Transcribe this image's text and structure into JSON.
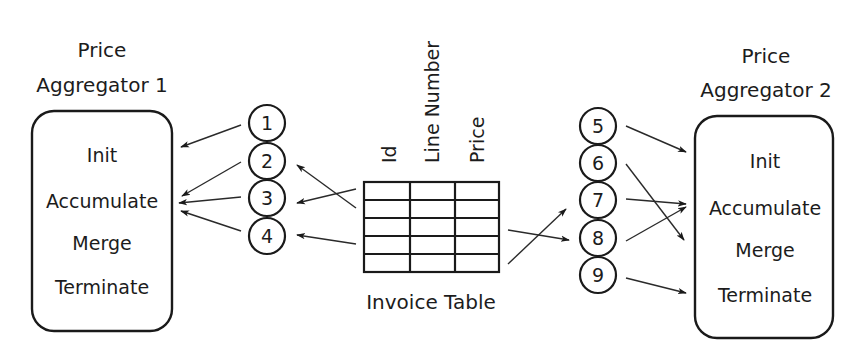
{
  "aggregator1": {
    "title_line1": "Price",
    "title_line2": "Aggregator 1",
    "methods": [
      "Init",
      "Accumulate",
      "Merge",
      "Terminate"
    ]
  },
  "aggregator2": {
    "title_line1": "Price",
    "title_line2": "Aggregator 2",
    "methods": [
      "Init",
      "Accumulate",
      "Merge",
      "Terminate"
    ]
  },
  "invoice_table": {
    "caption": "Invoice Table",
    "columns": [
      "Id",
      "Line Number",
      "Price"
    ],
    "row_count": 5
  },
  "left_steps": [
    "1",
    "2",
    "3",
    "4"
  ],
  "right_steps": [
    "5",
    "6",
    "7",
    "8",
    "9"
  ],
  "edges": [
    {
      "from": "1",
      "to": "Aggregator 1.Init"
    },
    {
      "from": "2",
      "to": "Aggregator 1.Accumulate"
    },
    {
      "from": "3",
      "to": "Aggregator 1.Accumulate"
    },
    {
      "from": "4",
      "to": "Aggregator 1.Accumulate"
    },
    {
      "from": "Invoice Table",
      "to": "2"
    },
    {
      "from": "Invoice Table",
      "to": "3"
    },
    {
      "from": "Invoice Table",
      "to": "4"
    },
    {
      "from": "Invoice Table",
      "to": "7"
    },
    {
      "from": "Invoice Table",
      "to": "8"
    },
    {
      "from": "5",
      "to": "Aggregator 2.Init"
    },
    {
      "from": "6",
      "to": "Aggregator 2.Merge"
    },
    {
      "from": "7",
      "to": "Aggregator 2.Accumulate"
    },
    {
      "from": "8",
      "to": "Aggregator 2.Accumulate"
    },
    {
      "from": "9",
      "to": "Aggregator 2.Terminate"
    }
  ]
}
